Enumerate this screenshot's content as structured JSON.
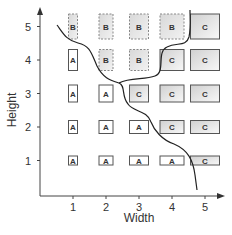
{
  "chart_data": {
    "type": "heatmap",
    "title": "",
    "xlabel": "Width",
    "ylabel": "Height",
    "x_ticks": [
      "1",
      "2",
      "3",
      "4",
      "5"
    ],
    "y_ticks": [
      "1",
      "2",
      "3",
      "4",
      "5"
    ],
    "grid": false,
    "cells": [
      {
        "w": 1,
        "h": 5,
        "label": "B"
      },
      {
        "w": 2,
        "h": 5,
        "label": "B"
      },
      {
        "w": 3,
        "h": 5,
        "label": "B"
      },
      {
        "w": 4,
        "h": 5,
        "label": "B"
      },
      {
        "w": 5,
        "h": 5,
        "label": "C"
      },
      {
        "w": 1,
        "h": 4,
        "label": "A"
      },
      {
        "w": 2,
        "h": 4,
        "label": "B"
      },
      {
        "w": 3,
        "h": 4,
        "label": "B"
      },
      {
        "w": 4,
        "h": 4,
        "label": "C"
      },
      {
        "w": 5,
        "h": 4,
        "label": "C"
      },
      {
        "w": 1,
        "h": 3,
        "label": "A"
      },
      {
        "w": 2,
        "h": 3,
        "label": "A"
      },
      {
        "w": 3,
        "h": 3,
        "label": "C"
      },
      {
        "w": 4,
        "h": 3,
        "label": "C"
      },
      {
        "w": 5,
        "h": 3,
        "label": "C"
      },
      {
        "w": 1,
        "h": 2,
        "label": "A"
      },
      {
        "w": 2,
        "h": 2,
        "label": "A"
      },
      {
        "w": 3,
        "h": 2,
        "label": "A"
      },
      {
        "w": 4,
        "h": 2,
        "label": "C"
      },
      {
        "w": 5,
        "h": 2,
        "label": "C"
      },
      {
        "w": 1,
        "h": 1,
        "label": "A"
      },
      {
        "w": 2,
        "h": 1,
        "label": "A"
      },
      {
        "w": 3,
        "h": 1,
        "label": "A"
      },
      {
        "w": 4,
        "h": 1,
        "label": "A"
      },
      {
        "w": 5,
        "h": 1,
        "label": "C"
      }
    ],
    "boundaries": [
      "A/B-C boundary curve",
      "B/C boundary curve"
    ]
  },
  "styles": {
    "A": {
      "fill": "#ffffff",
      "stroke": "#555555",
      "dash": ""
    },
    "B": {
      "fill": "#e4e4e4",
      "stroke": "#888888",
      "dash": "2,1.5"
    },
    "C": {
      "fill": "#e8e8e8",
      "stroke": "#555555",
      "dash": ""
    }
  }
}
